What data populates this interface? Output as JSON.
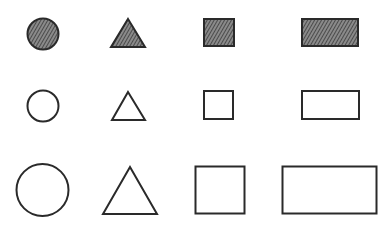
{
  "figure": {
    "stroke_color": "#2a2a2a",
    "hatch_color": "#555555",
    "background": "#ffffff",
    "columns": [
      "circle",
      "triangle",
      "square",
      "rectangle"
    ],
    "rows": [
      {
        "name": "hatched-small",
        "fill": "hatched"
      },
      {
        "name": "outline-small",
        "fill": "none"
      },
      {
        "name": "outline-large",
        "fill": "none"
      }
    ]
  }
}
